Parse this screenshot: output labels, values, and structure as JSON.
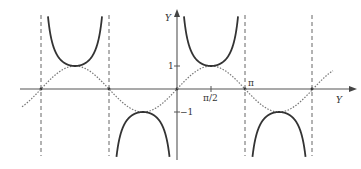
{
  "chart_data": {
    "type": "line",
    "title": "",
    "xlabel": "Y",
    "ylabel": "Y",
    "x_tick_labels": [
      "π/2",
      "π"
    ],
    "y_tick_labels": [
      "1",
      "−1"
    ],
    "series": [
      {
        "name": "csc x",
        "style": "solid",
        "description": "cosecant branches (U-shaped above, inverted-U below)"
      },
      {
        "name": "sin x",
        "style": "dotted",
        "description": "sine curve"
      }
    ],
    "asymptotes": [
      "-2π",
      "-π",
      "0",
      "π",
      "2π"
    ],
    "x_range": [
      "-2.2π",
      "2.3π"
    ],
    "y_range": [
      -3,
      3.8
    ],
    "grid": false
  },
  "labels": {
    "y_axis": "Y",
    "x_axis": "Y",
    "tick_one": "1",
    "tick_minus_one": "−1",
    "tick_half_pi": "π/2",
    "tick_pi": "π"
  },
  "colors": {
    "axis": "#555555",
    "curve_solid": "#333333",
    "curve_dotted": "#777777",
    "asymptote": "#666666"
  }
}
